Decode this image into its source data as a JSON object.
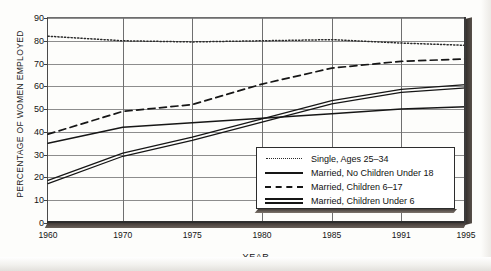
{
  "chart_data": {
    "type": "line",
    "title": "",
    "xlabel": "YEAR",
    "ylabel": "PERCENTAGE OF WOMEN EMPLOYED",
    "xlim": [
      1960,
      1995
    ],
    "ylim": [
      0,
      90
    ],
    "grid": true,
    "legend_position": "inside lower-right",
    "xticks": [
      1960,
      1970,
      1975,
      1980,
      1985,
      1991,
      1995
    ],
    "xtick_labels": [
      "1960",
      "1970",
      "1975",
      "1980",
      "1985",
      "1991",
      "1995"
    ],
    "yticks": [
      0,
      10,
      20,
      30,
      40,
      50,
      60,
      70,
      80,
      90
    ],
    "ytick_labels": [
      "0",
      "10",
      "20",
      "30",
      "40",
      "50",
      "60",
      "70",
      "80",
      "90"
    ],
    "x": [
      1960,
      1970,
      1975,
      1980,
      1985,
      1991,
      1995
    ],
    "series": [
      {
        "name": "Single, Ages 25-34",
        "style": "dotted",
        "color": "#2b2b2b",
        "values": [
          82,
          80,
          79.5,
          80,
          80.5,
          79,
          78
        ]
      },
      {
        "name": "Married, No Children Under 18",
        "style": "solid",
        "color": "#161616",
        "values": [
          35,
          42,
          44,
          46,
          48,
          50,
          51
        ]
      },
      {
        "name": "Married, Children 6-17",
        "style": "dashed",
        "color": "#161616",
        "values": [
          39,
          49,
          52,
          61,
          68,
          71,
          72
        ]
      },
      {
        "name": "Married, Children Under 6",
        "style": "double",
        "color": "#161616",
        "values": [
          18,
          30,
          37,
          45,
          53,
          58,
          60
        ]
      }
    ],
    "legend": [
      {
        "label": "Single, Ages 25–34",
        "style": "dotted"
      },
      {
        "label": "Married, No Children Under 18",
        "style": "solid"
      },
      {
        "label": "Married, Children 6–17",
        "style": "dashed"
      },
      {
        "label": "Married, Children Under 6",
        "style": "double"
      }
    ]
  }
}
